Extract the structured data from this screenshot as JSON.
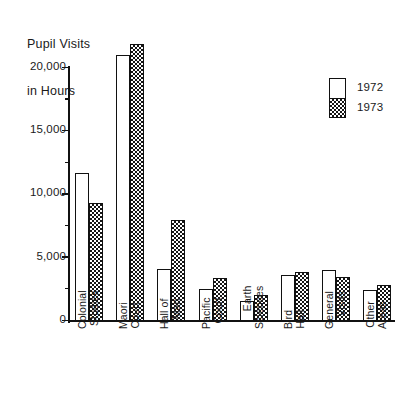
{
  "chart_data": {
    "type": "bar",
    "title": "Pupil Visits in Hours",
    "title_lines": [
      "Pupil Visits",
      "in Hours"
    ],
    "xlabel": "",
    "ylabel": "Pupil Visits in Hours",
    "ylim": [
      0,
      20000
    ],
    "yticks": [
      0,
      5000,
      10000,
      15000,
      20000
    ],
    "ytick_labels": [
      "0",
      "5,000",
      "10,000",
      "15,000",
      "20,000"
    ],
    "minor_tick_interval": 2500,
    "grid": false,
    "legend_position": "upper-right",
    "categories": [
      "Colonial Studies",
      "Maori Court",
      "Hall of Man",
      "Pacific Court",
      "Earth Sciences",
      "Bird Hall",
      "General Visits",
      "Other Areas"
    ],
    "category_lines": [
      [
        "Colonial",
        "Studies"
      ],
      [
        "Maori",
        "Court"
      ],
      [
        "Hall of",
        "Man"
      ],
      [
        "Pacific",
        "Court"
      ],
      [
        "Earth",
        "Sciences"
      ],
      [
        "Bird",
        "Hall"
      ],
      [
        "General",
        "Visits"
      ],
      [
        "Other",
        "Areas"
      ]
    ],
    "series": [
      {
        "name": "1972",
        "fill": "white",
        "values": [
          11700,
          21000,
          4150,
          2500,
          1550,
          3600,
          4050,
          2450
        ]
      },
      {
        "name": "1973",
        "fill": "checkered",
        "values": [
          9350,
          21900,
          7950,
          3400,
          2050,
          3900,
          3450,
          2850
        ]
      }
    ]
  },
  "legend": {
    "entries": [
      {
        "label": "1972"
      },
      {
        "label": "1973"
      }
    ]
  },
  "colors": {
    "ink": "#111111",
    "background": "#ffffff",
    "series_1972": "#ffffff",
    "series_1973": "#151515"
  }
}
